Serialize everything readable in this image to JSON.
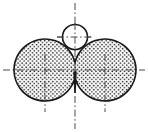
{
  "figure": {
    "type": "engineering-drawing",
    "canvas": {
      "width": 148,
      "height": 132,
      "background": "#ffffff"
    },
    "style": {
      "outline_color": "#1a1a1a",
      "outline_width": 1.6,
      "centerline_color": "#4a4a4a",
      "centerline_width": 1.0,
      "centerline_dash": "7,2.5,1.6,2.5",
      "hatch_type": "stipple-dots",
      "hatch_color": "#2b2b2b",
      "hatch_dot_radius": 0.85,
      "hatch_spacing": 4.1,
      "hatch_background": "#ffffff"
    },
    "geometry": {
      "left_lobe": {
        "cx": 45.0,
        "cy": 70.0,
        "r": 31.0
      },
      "right_lobe": {
        "cx": 105.0,
        "cy": 70.0,
        "r": 31.0
      },
      "notch_vertex": {
        "x": 75.0,
        "y": 93.0
      },
      "top_apex": {
        "x": 75.0,
        "y": 13.5
      },
      "left_extreme": {
        "x": 14.0,
        "y": 70.0
      },
      "right_extreme": {
        "x": 136.0,
        "y": 70.0
      },
      "bore_hole": {
        "cx": 75.0,
        "cy": 37.0,
        "r": 12.5
      }
    },
    "centerlines": [
      {
        "name": "main-horizontal-centerline",
        "orientation": "horizontal",
        "y": 70.0,
        "x1": 3.0,
        "x2": 145.0
      },
      {
        "name": "main-vertical-centerline",
        "orientation": "vertical",
        "x": 75.0,
        "y1": 3.0,
        "y2": 129.0
      },
      {
        "name": "left-lobe-vertical-centerline",
        "orientation": "vertical",
        "x": 45.0,
        "y1": 54.0,
        "y2": 112.0
      },
      {
        "name": "right-lobe-vertical-centerline",
        "orientation": "vertical",
        "x": 105.0,
        "y1": 54.0,
        "y2": 112.0
      },
      {
        "name": "bore-horizontal-centerline",
        "orientation": "horizontal",
        "y": 37.0,
        "x1": 57.0,
        "x2": 93.0
      }
    ]
  }
}
